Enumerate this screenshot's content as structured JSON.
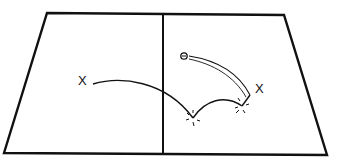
{
  "diagram": {
    "type": "court-shot-trajectory",
    "court": {
      "outline": [
        [
          47,
          13
        ],
        [
          284,
          15
        ],
        [
          327,
          155
        ],
        [
          4,
          153
        ]
      ],
      "net_line": [
        [
          163,
          14
        ],
        [
          163,
          154
        ]
      ],
      "line_color": "#111111"
    },
    "markers": {
      "left_player": {
        "label": "X",
        "x": 78,
        "y": 74
      },
      "right_player": {
        "label": "X",
        "x": 255,
        "y": 82
      },
      "ball": {
        "label": "o",
        "x": 184,
        "y": 56
      },
      "bounce_1": {
        "x": 193,
        "y": 118
      },
      "bounce_2": {
        "x": 242,
        "y": 106
      }
    }
  }
}
